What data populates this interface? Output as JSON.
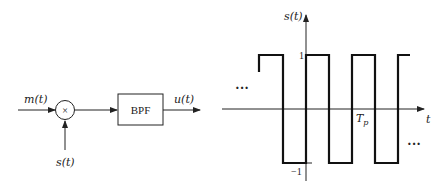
{
  "block_diagram": {
    "input_label": "m(t)",
    "multiplier_symbol": "×",
    "carrier_label": "s(t)",
    "filter_label": "BPF",
    "output_label": "u(t)"
  },
  "waveform": {
    "y_axis_label": "s(t)",
    "x_axis_label": "t",
    "tick_high": "1",
    "tick_low": "−1",
    "period_label": "T",
    "period_subscript": "p",
    "ellipsis_left": "···",
    "ellipsis_right": "···",
    "levels": [
      1,
      -1
    ],
    "type": "square-wave"
  }
}
